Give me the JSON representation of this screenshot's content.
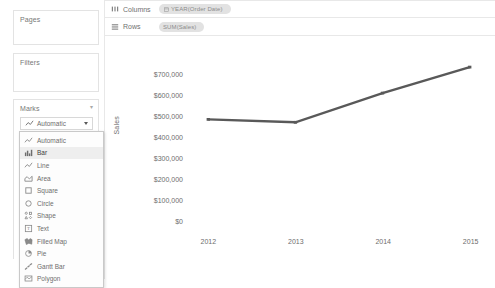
{
  "left_panel": {
    "pages_card": {
      "title": "Pages"
    },
    "filters_card": {
      "title": "Filters"
    },
    "marks_card": {
      "title": "Marks",
      "selected_type": "Automatic",
      "selected_icon": "line-mark-icon",
      "options": [
        {
          "label": "Automatic",
          "icon": "line-mark-icon",
          "highlighted": false
        },
        {
          "label": "Bar",
          "icon": "bar-mark-icon",
          "highlighted": true
        },
        {
          "label": "Line",
          "icon": "line-mark-icon",
          "highlighted": false
        },
        {
          "label": "Area",
          "icon": "area-mark-icon",
          "highlighted": false
        },
        {
          "label": "Square",
          "icon": "square-mark-icon",
          "highlighted": false
        },
        {
          "label": "Circle",
          "icon": "circle-mark-icon",
          "highlighted": false
        },
        {
          "label": "Shape",
          "icon": "shape-mark-icon",
          "highlighted": false
        },
        {
          "label": "Text",
          "icon": "text-mark-icon",
          "highlighted": false
        },
        {
          "label": "Filled Map",
          "icon": "filled-map-mark-icon",
          "highlighted": false
        },
        {
          "label": "Pie",
          "icon": "pie-mark-icon",
          "highlighted": false
        },
        {
          "label": "Gantt Bar",
          "icon": "gantt-bar-mark-icon",
          "highlighted": false
        },
        {
          "label": "Polygon",
          "icon": "polygon-mark-icon",
          "highlighted": false
        }
      ]
    }
  },
  "shelves": {
    "columns": {
      "label": "Columns",
      "pill": "YEAR(Order Date)",
      "pill_icon": "calendar-icon"
    },
    "rows": {
      "label": "Rows",
      "pill": "SUM(Sales)",
      "pill_icon": ""
    }
  },
  "chart_data": {
    "type": "line",
    "title": "",
    "xlabel": "",
    "ylabel": "Sales",
    "categories": [
      "2012",
      "2013",
      "2014",
      "2015"
    ],
    "values": [
      484000,
      470000,
      609000,
      733000
    ],
    "ylim": [
      0,
      700000
    ],
    "yticks": [
      700000,
      600000,
      500000,
      400000,
      300000,
      200000,
      100000,
      0
    ],
    "ytick_labels": [
      "$700,000",
      "$600,000",
      "$500,000",
      "$400,000",
      "$300,000",
      "$200,000",
      "$100,000",
      "$0"
    ],
    "grid": false,
    "legend": false,
    "line_color": "#595959"
  }
}
